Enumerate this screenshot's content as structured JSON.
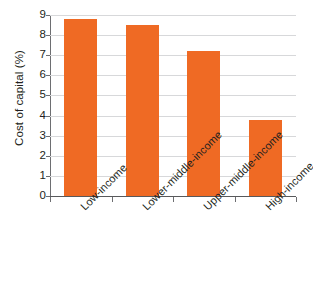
{
  "chart_data": {
    "type": "bar",
    "title": "",
    "subtitle": "",
    "xlabel": "",
    "ylabel": "Cost of capital (%)",
    "categories": [
      "Low-income",
      "Lower-middle-income",
      "Upper-middle-income",
      "High-income"
    ],
    "values": [
      8.8,
      8.5,
      7.2,
      3.8
    ],
    "series": [
      {
        "name": "Cost of capital",
        "values": [
          8.8,
          8.5,
          7.2,
          3.8
        ]
      }
    ],
    "ylim": [
      0,
      9
    ],
    "ytick_labels": [
      "0",
      "1",
      "2",
      "3",
      "4",
      "5",
      "6",
      "7",
      "8",
      "9"
    ],
    "ytick_values": [
      0,
      1,
      2,
      3,
      4,
      5,
      6,
      7,
      8,
      9
    ],
    "grid": true,
    "grid_axis": "y",
    "legend": false,
    "legend_position": "none",
    "annotations": [],
    "colors": {
      "bar": "#ef6a24",
      "gridline": "#d7d8da",
      "axis": "#58595b",
      "text": "#231f20",
      "background": "#ffffff"
    }
  }
}
